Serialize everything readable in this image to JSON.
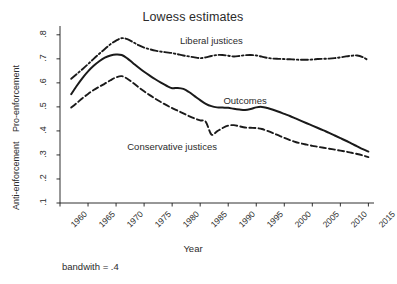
{
  "chart_data": {
    "type": "line",
    "title": "Lowess estimates",
    "xlabel": "Year",
    "footnote": "bandwith = .4",
    "ylabel_upper": "Pro-enforcement",
    "ylabel_lower": "Anti-enforcement",
    "xlim": [
      1960,
      2016
    ],
    "ylim": [
      0.1,
      0.82
    ],
    "xticks": [
      1960,
      1965,
      1970,
      1975,
      1980,
      1985,
      1990,
      1995,
      2000,
      2005,
      2010,
      2015
    ],
    "xtick_labels": [
      "1960",
      "1965",
      "1970",
      "1975",
      "1980",
      "1985",
      "1990",
      "1995",
      "2000",
      "2005",
      "2010",
      "2015"
    ],
    "yticks": [
      0.1,
      0.2,
      0.3,
      0.4,
      0.5,
      0.6,
      0.7,
      0.8
    ],
    "ytick_labels": [
      ".1",
      ".2",
      ".3",
      ".4",
      ".5",
      ".6",
      ".7",
      ".8"
    ],
    "grid": false,
    "legend_position": "inline-annotations",
    "line_color": "#1a1a1a",
    "series": [
      {
        "name": "Liberal justices",
        "style": "dash-dot",
        "label_x": 1987,
        "label_y": 0.775,
        "x": [
          1962,
          1963,
          1964,
          1965,
          1966,
          1967,
          1968,
          1969,
          1970,
          1971,
          1972,
          1973,
          1974,
          1975,
          1976,
          1977,
          1978,
          1979,
          1980,
          1981,
          1982,
          1983,
          1984,
          1985,
          1986,
          1987,
          1988,
          1989,
          1990,
          1991,
          1992,
          1993,
          1994,
          1995,
          1996,
          1997,
          1998,
          1999,
          2000,
          2001,
          2002,
          2003,
          2004,
          2005,
          2006,
          2007,
          2008,
          2009,
          2010,
          2011,
          2012,
          2013,
          2014,
          2015
        ],
        "y": [
          0.617,
          0.637,
          0.657,
          0.678,
          0.7,
          0.721,
          0.741,
          0.761,
          0.776,
          0.786,
          0.782,
          0.77,
          0.757,
          0.747,
          0.74,
          0.734,
          0.73,
          0.727,
          0.724,
          0.719,
          0.714,
          0.71,
          0.706,
          0.703,
          0.706,
          0.712,
          0.716,
          0.716,
          0.713,
          0.71,
          0.712,
          0.715,
          0.716,
          0.714,
          0.709,
          0.704,
          0.701,
          0.7,
          0.699,
          0.698,
          0.697,
          0.696,
          0.696,
          0.697,
          0.699,
          0.7,
          0.701,
          0.703,
          0.706,
          0.71,
          0.713,
          0.714,
          0.707,
          0.694
        ]
      },
      {
        "name": "Outcomes",
        "style": "solid",
        "label_x": 1993,
        "label_y": 0.525,
        "x": [
          1962,
          1963,
          1964,
          1965,
          1966,
          1967,
          1968,
          1969,
          1970,
          1971,
          1972,
          1973,
          1974,
          1975,
          1976,
          1977,
          1978,
          1979,
          1980,
          1981,
          1982,
          1983,
          1984,
          1985,
          1986,
          1987,
          1988,
          1989,
          1990,
          1991,
          1992,
          1993,
          1994,
          1995,
          1996,
          1997,
          1998,
          1999,
          2000,
          2001,
          2002,
          2003,
          2004,
          2005,
          2006,
          2007,
          2008,
          2009,
          2010,
          2011,
          2012,
          2013,
          2014,
          2015
        ],
        "y": [
          0.553,
          0.588,
          0.62,
          0.648,
          0.671,
          0.69,
          0.705,
          0.714,
          0.718,
          0.716,
          0.702,
          0.683,
          0.664,
          0.646,
          0.63,
          0.615,
          0.601,
          0.588,
          0.578,
          0.579,
          0.575,
          0.562,
          0.545,
          0.528,
          0.513,
          0.503,
          0.498,
          0.497,
          0.496,
          0.492,
          0.489,
          0.487,
          0.491,
          0.498,
          0.5,
          0.495,
          0.488,
          0.48,
          0.471,
          0.462,
          0.452,
          0.442,
          0.432,
          0.422,
          0.412,
          0.402,
          0.392,
          0.381,
          0.37,
          0.359,
          0.347,
          0.336,
          0.324,
          0.314
        ]
      },
      {
        "name": "Conservative justices",
        "style": "dashed",
        "label_x": 1980,
        "label_y": 0.333,
        "x": [
          1962,
          1963,
          1964,
          1965,
          1966,
          1967,
          1968,
          1969,
          1970,
          1971,
          1972,
          1973,
          1974,
          1975,
          1976,
          1977,
          1978,
          1979,
          1980,
          1981,
          1982,
          1983,
          1984,
          1985,
          1986,
          1987,
          1988,
          1989,
          1990,
          1991,
          1992,
          1993,
          1994,
          1995,
          1996,
          1997,
          1998,
          1999,
          2000,
          2001,
          2002,
          2003,
          2004,
          2005,
          2006,
          2007,
          2008,
          2009,
          2010,
          2011,
          2012,
          2013,
          2014,
          2015
        ],
        "y": [
          0.497,
          0.516,
          0.536,
          0.554,
          0.57,
          0.584,
          0.597,
          0.611,
          0.623,
          0.628,
          0.617,
          0.6,
          0.582,
          0.565,
          0.549,
          0.534,
          0.52,
          0.507,
          0.495,
          0.484,
          0.473,
          0.462,
          0.452,
          0.444,
          0.438,
          0.385,
          0.398,
          0.412,
          0.422,
          0.424,
          0.419,
          0.414,
          0.413,
          0.412,
          0.408,
          0.4,
          0.391,
          0.381,
          0.371,
          0.362,
          0.354,
          0.348,
          0.343,
          0.338,
          0.334,
          0.33,
          0.326,
          0.322,
          0.318,
          0.314,
          0.309,
          0.304,
          0.298,
          0.291
        ]
      }
    ]
  }
}
